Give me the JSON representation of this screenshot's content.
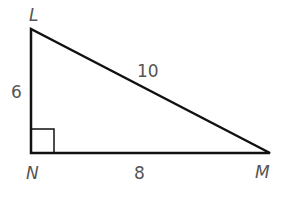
{
  "diagram": {
    "type": "right-triangle",
    "vertices": {
      "L": {
        "label": "L"
      },
      "N": {
        "label": "N"
      },
      "M": {
        "label": "M"
      }
    },
    "sides": {
      "LN": {
        "label": "6"
      },
      "NM": {
        "label": "8"
      },
      "LM": {
        "label": "10"
      }
    },
    "right_angle_at": "N",
    "colors": {
      "stroke": "#111111",
      "label": "#555555",
      "background": "#ffffff"
    }
  }
}
